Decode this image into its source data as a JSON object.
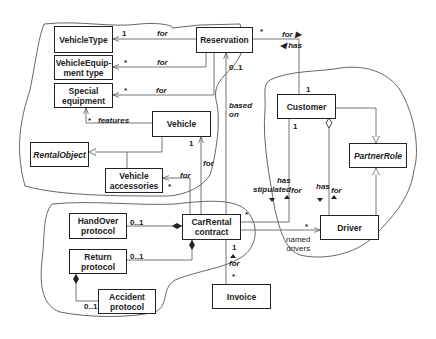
{
  "diagram": {
    "type": "UML class diagram",
    "classes": {
      "vehicle_type": "VehicleType",
      "vehicle_equipment_type": "VehicleEquip-\nment type",
      "special_equipment": "Special\nequipment",
      "reservation": "Reservation",
      "vehicle": "Vehicle",
      "rental_object": "RentalObject",
      "vehicle_accessories": "Vehicle\naccessories",
      "customer": "Customer",
      "partner_role": "PartnerRole",
      "handover_protocol": "HandOver\nprotocol",
      "carrental_contract": "CarRental\ncontract",
      "driver": "Driver",
      "return_protocol": "Return\nprotocol",
      "accident_protocol": "Accident\nprotocol",
      "invoice": "Invoice"
    },
    "labels": {
      "vt_mult": "1",
      "vt_for": "for",
      "vet_mult": "*",
      "vet_for": "for",
      "se_mult": "*",
      "se_for": "for",
      "features_mult": "*",
      "features": "features",
      "vehicle_mult": "1",
      "vehicle_for": "for",
      "acc_for": "for",
      "acc_mult": "*",
      "res_mult": "*",
      "res_for": "for ▶",
      "res_has": "◀ has",
      "res_based_mult": "0..1",
      "based_on": "based\non",
      "cust_mult": "1",
      "cust_mult2": "1",
      "has_stipulated": "has\nstipulated",
      "stip_for": "for",
      "has2": "has",
      "for2": "for",
      "handover_mult": "0..1",
      "return_mult": "0..1",
      "accident_mult": "0..1",
      "contract_star": "*",
      "driver_star": "*",
      "named_drivers": "named\ndrivers",
      "invoice_one": "1",
      "invoice_for": "for",
      "invoice_star": "*"
    }
  }
}
